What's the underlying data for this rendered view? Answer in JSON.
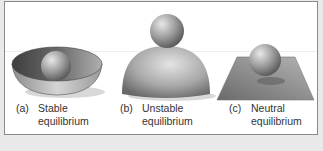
{
  "figure": {
    "panels": [
      {
        "id": "a",
        "tag": "(a)",
        "line1": "Stable",
        "line2": "equilibrium",
        "shape": "bowl-with-ball"
      },
      {
        "id": "b",
        "tag": "(b)",
        "line1": "Unstable",
        "line2": "equilibrium",
        "shape": "dome-with-ball"
      },
      {
        "id": "c",
        "tag": "(c)",
        "line1": "Neutral",
        "line2": "equilibrium",
        "shape": "plane-with-ball"
      }
    ],
    "colors": {
      "background": "#e9e9e9",
      "frame": "#ffffff",
      "border": "#8a8a8a",
      "surface_dark": "#5a5a5a",
      "surface_light": "#c8c8c8"
    }
  }
}
